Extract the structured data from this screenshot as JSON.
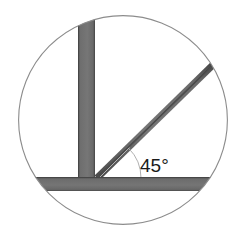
{
  "figure": {
    "background_color": "#ffffff",
    "annotation": {
      "angle_label": "45°",
      "angle_value": 45,
      "angle_units": "degrees",
      "label_color": "#1a1a1a"
    },
    "circle_frame": {
      "name": "circular-viewport",
      "center_x": 123,
      "center_y": 120,
      "radius": 105,
      "stroke_color": "#8c8c8c",
      "stroke_width": 1.1,
      "fill": "none"
    },
    "members": [
      {
        "name": "vertical-member",
        "orientation": "vertical",
        "fill_color": "#6f6f6f",
        "edge_color": "#4a4a4a",
        "x_start": 78,
        "x_end": 95,
        "y_start": 16,
        "y_end": 190
      },
      {
        "name": "horizontal-member",
        "orientation": "horizontal",
        "fill_color": "#6f6f6f",
        "edge_color": "#4a4a4a",
        "x_start": 33,
        "x_end": 216,
        "y_start": 177,
        "y_end": 191
      },
      {
        "name": "diagonal-member",
        "orientation": "diagonal",
        "fill_color": "#6f6f6f",
        "edge_color": "#3c3c3c",
        "thickness": 7,
        "vertex_x": 97,
        "vertex_y": 177,
        "tip_x": 217,
        "tip_y": 61,
        "slope_degrees": 45
      }
    ],
    "angle_guides": {
      "name": "angle-measure-guides",
      "stroke_color": "#a8a8a8",
      "stroke_width": 1,
      "vertex_x": 99,
      "vertex_y": 178,
      "baseline_end_x": 167,
      "baseline_end_y": 178,
      "arc_radius": 42
    }
  }
}
